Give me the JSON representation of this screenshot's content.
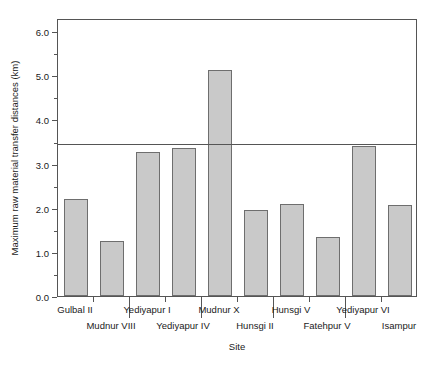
{
  "chart_data": {
    "type": "bar",
    "title": "",
    "xlabel": "Site",
    "ylabel": "Maximum raw material transfer distances (km)",
    "categories": [
      "Gulbal II",
      "Mudnur VIII",
      "Yediyapur I",
      "Yediyapur IV",
      "Mudnur X",
      "Hunsgi II",
      "Hunsgi V",
      "Fatehpur V",
      "Yediyapur VI",
      "Isampur"
    ],
    "values": [
      2.2,
      1.25,
      3.27,
      3.35,
      5.13,
      1.96,
      2.08,
      1.34,
      3.39,
      2.07
    ],
    "ylim": [
      0.0,
      6.3
    ],
    "xlim": [
      0,
      10
    ],
    "y_major_ticks": [
      0.0,
      1.0,
      2.0,
      3.0,
      4.0,
      5.0,
      6.0
    ],
    "y_tick_labels": [
      "0.0",
      "1.0",
      "2.0",
      "3.0",
      "4.0",
      "5.0",
      "6.0"
    ],
    "y_minor_ticks": [
      0.5,
      1.5,
      2.5,
      3.5,
      4.5,
      5.5
    ],
    "annotations": [
      {
        "type": "hline",
        "value": 3.5,
        "label": "reference line at 3.5 km"
      }
    ],
    "grid": false,
    "legend": null,
    "bar_fill": "#c9c9c9",
    "bar_edge": "#6e6e6e",
    "axis_color": "#555555",
    "label_rows": [
      "a",
      "b",
      "a",
      "b",
      "a",
      "b",
      "a",
      "b",
      "a",
      "b"
    ]
  },
  "axes": {
    "y_title": "Maximum raw material transfer distances (km)",
    "x_title": "Site"
  }
}
